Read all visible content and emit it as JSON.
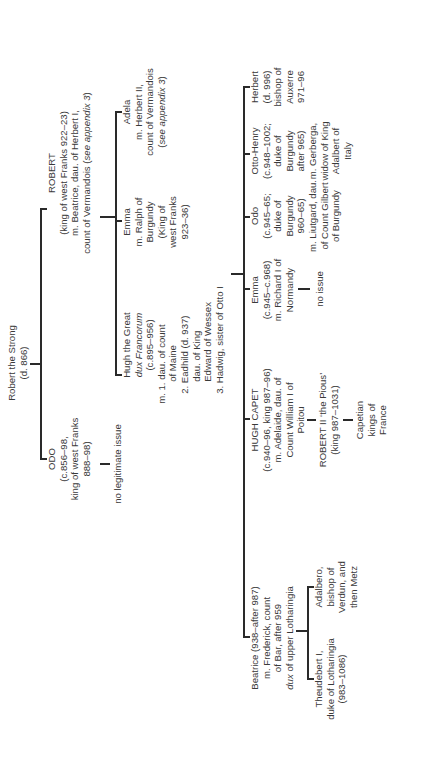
{
  "diagram": {
    "orientation": "rotated 90 degrees counter-clockwise",
    "root": {
      "name": "Robert the Strong",
      "lines": [
        "Robert the Strong",
        "(d. 866)"
      ]
    },
    "generation1": [
      {
        "id": "odo",
        "lines": [
          "ODO",
          "(c.856–98,",
          "king of west Franks",
          "888–98)"
        ],
        "issue": "no legitimate issue"
      },
      {
        "id": "robert",
        "lines": [
          "ROBERT",
          "(king of west Franks 922–23)",
          "m. Beatrice, dau. of Herbert I,",
          "count of Vermandois (see appendix 3)"
        ],
        "italic_fragment": "appendix 3"
      }
    ],
    "generation2": [
      {
        "id": "hugh-the-great",
        "lines": [
          "Hugh the Great",
          "dux Francorum",
          "(c.895–956)",
          "m. 1. dau. of count",
          "of Maine",
          "2. Eadhild (d. 937)",
          "dau. of King",
          "Edward of Wessex",
          "3. Hadwig, sister of Otto I"
        ],
        "italic_line": "dux Francorum"
      },
      {
        "id": "emma-burgundy",
        "lines": [
          "Emma",
          "m. Ralph of",
          "Burgundy",
          "(King of",
          "west Franks",
          "923–36)"
        ]
      },
      {
        "id": "adela",
        "lines": [
          "Adela",
          "m. Herbert II,",
          "count of Vermandois",
          "(see appendix 3)"
        ],
        "italic_fragment": "appendix 3"
      }
    ],
    "generation3": [
      {
        "id": "beatrice",
        "lines": [
          "Beatrice (938–after 987)",
          "m. Frederick, count",
          "of Bar, after 959",
          "dux of upper Lotharingia"
        ],
        "italic_fragment": "dux",
        "children": [
          {
            "id": "theudebert",
            "lines": [
              "Theudebert I,",
              "duke of Lotharingia",
              "(983–1086)"
            ]
          },
          {
            "id": "adalbero",
            "lines": [
              "Adalbero,",
              "bishop of",
              "Verdun, and",
              "then Metz"
            ]
          }
        ]
      },
      {
        "id": "hugh-capet",
        "lines": [
          "HUGH CAPET",
          "(c.940–96, king 987–96)",
          "m. Adelaide, dau. of",
          "Count William I of",
          "Poitou"
        ],
        "descendants": [
          {
            "id": "robert-ii",
            "lines": [
              "ROBERT II ‘the Pious’",
              "(king 987–1031)"
            ]
          },
          {
            "id": "capetians",
            "lines": [
              "Capetian",
              "kings of",
              "France"
            ]
          }
        ]
      },
      {
        "id": "emma-normandy",
        "lines": [
          "Emma",
          "(c.945–c.968)",
          "m. Richard I of",
          "Normandy"
        ],
        "issue": "no issue"
      },
      {
        "id": "odo-burgundy",
        "lines": [
          "Odo",
          "(c.945–65;",
          "duke of",
          "Burgundy",
          "960–65)",
          "m. Liutgard, dau.",
          "of Count Gilbert",
          "of Burgundy"
        ]
      },
      {
        "id": "otto-henry",
        "lines": [
          "Otto-Henry",
          "(c.948–1002;",
          "duke of",
          "Burgundy",
          "after 965)",
          "m. Gerberga,",
          "widow of King",
          "Adalbert of",
          "Italy"
        ]
      },
      {
        "id": "herbert",
        "lines": [
          "Herbert",
          "(d. 996)",
          "bishop of",
          "Auxerre",
          "971–96"
        ]
      }
    ]
  }
}
